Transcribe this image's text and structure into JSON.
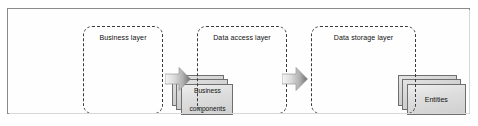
{
  "diagram": {
    "frame": {
      "border_color": "#8b8b8b",
      "background": "#fefefe"
    },
    "layers": [
      {
        "id": "business",
        "title": "Business layer",
        "node": {
          "label_line1": "Business",
          "label_line2": "components",
          "kind": "stacked-cards",
          "stack_depth": 3
        }
      },
      {
        "id": "data-access",
        "title": "Data access layer",
        "node": {
          "label_line1": "Entities",
          "label_line2": "",
          "kind": "stacked-cards",
          "stack_depth": 3
        }
      },
      {
        "id": "data-storage",
        "title": "Data storage layer",
        "nodes": [
          {
            "id": "rdbms",
            "label_line1": "RDBMS",
            "label_line2": "",
            "kind": "cylinder"
          },
          {
            "id": "directory-server",
            "label_line1": "Directory",
            "label_line2": "server",
            "kind": "cylinder"
          }
        ]
      }
    ],
    "arrows": [
      {
        "id": "arrow-business-to-data-access",
        "direction": "right"
      },
      {
        "id": "arrow-data-access-to-data-storage",
        "direction": "right"
      }
    ],
    "colors": {
      "layer_border": "#3a3a3a",
      "card_fill": "#dedede",
      "card_border": "#6f6f6f",
      "cylinder_mid": "#d6d6d6",
      "cylinder_edge": "#7d7d7d",
      "arrow_light": "#f2f2f2",
      "arrow_dark": "#6f6f6f",
      "text": "#111111"
    }
  }
}
